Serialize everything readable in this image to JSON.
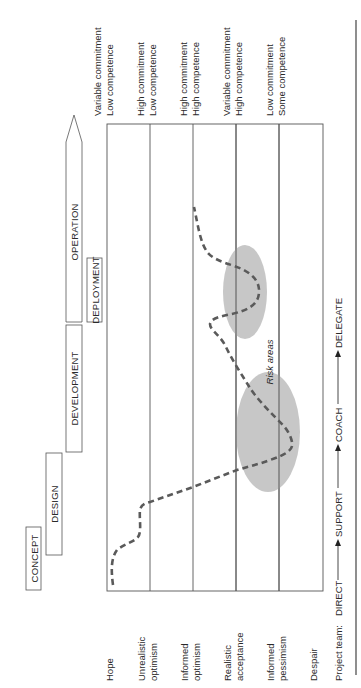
{
  "diagram": {
    "type": "emotional-cycle-of-change",
    "orientation": "rotated-90-ccw",
    "phases": [
      {
        "label": "CONCEPT"
      },
      {
        "label": "DESIGN"
      },
      {
        "label": "DEVELOPMENT"
      },
      {
        "label": "DEPLOYMENT"
      },
      {
        "label": "OPERATION"
      }
    ],
    "emotional_states": [
      {
        "line1": "Hope",
        "line2": ""
      },
      {
        "line1": "Unrealistic",
        "line2": "optimism"
      },
      {
        "line1": "Informed",
        "line2": "optimism"
      },
      {
        "line1": "Realistic",
        "line2": "acceptance"
      },
      {
        "line1": "Informed",
        "line2": "pessimism"
      },
      {
        "line1": "Despair",
        "line2": ""
      }
    ],
    "team_states": [
      {
        "line1": "Variable commitment",
        "line2": "Low competence"
      },
      {
        "line1": "High commitment",
        "line2": "Low competence"
      },
      {
        "line1": "High commitment",
        "line2": "High competence"
      },
      {
        "line1": "Variable commitment",
        "line2": "High competence"
      },
      {
        "line1": "Low commitment",
        "line2": "Some competence"
      }
    ],
    "risk_label": "Risk areas",
    "project_team": {
      "label": "Project team:",
      "stages": [
        "DIRECT",
        "SUPPORT",
        "COACH",
        "DELEGATE"
      ]
    },
    "colors": {
      "line": "#555555",
      "curve": "#5a5a5a",
      "risk_fill": "#bdbdbd",
      "text": "#2a2a2a"
    }
  }
}
